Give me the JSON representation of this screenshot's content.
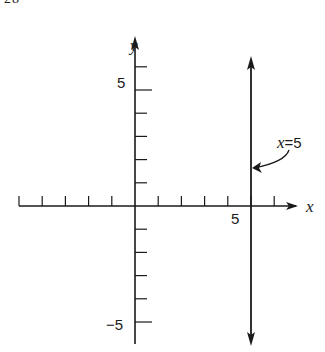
{
  "page": {
    "header_fragment": "28"
  },
  "diagram": {
    "axes": {
      "x_label": "x",
      "y_label": "y",
      "x_ticks": [
        -5,
        -4,
        -3,
        -2,
        -1,
        1,
        2,
        3,
        4,
        5,
        6
      ],
      "y_ticks": [
        6,
        5,
        4,
        3,
        2,
        1,
        -1,
        -2,
        -3,
        -4,
        -5
      ],
      "x_tick_labels": [
        {
          "value": 5,
          "text": "5"
        }
      ],
      "y_tick_labels": [
        {
          "value": 5,
          "text": "5"
        },
        {
          "value": -5,
          "text": "−5"
        }
      ]
    },
    "line": {
      "equation": "x = 5",
      "x_value": 5,
      "label_lhs": "x",
      "label_rhs": "=5",
      "color": "#1a1a1a"
    }
  }
}
